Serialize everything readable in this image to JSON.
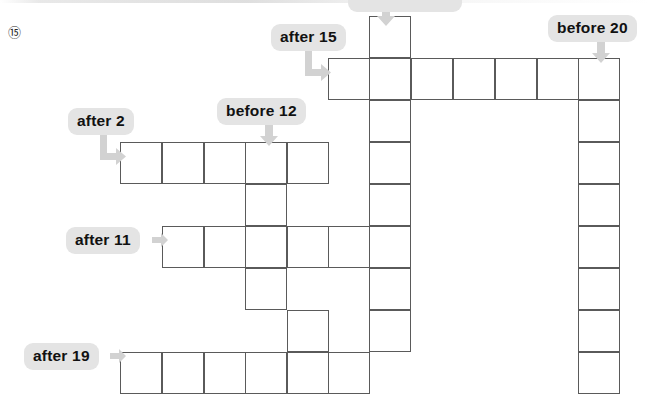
{
  "page": {
    "question_number": "⑮",
    "background": "#ffffff",
    "grid_line_color": "#5a5a5a",
    "tag_background": "#e4e4e4",
    "tag_text_color": "#111111",
    "arrow_color": "#d2d2d2"
  },
  "clues": [
    {
      "id": "clue-top-clipped",
      "label": "",
      "x": 348,
      "y": -8,
      "width": 96,
      "clipped": true,
      "arrow": "down",
      "arrow_x": 376,
      "arrow_y": 4
    },
    {
      "id": "clue-after-15",
      "label": "after 15",
      "x": 271,
      "y": 24,
      "arrow": "down-right",
      "arrow_x": 305,
      "arrow_y": 49
    },
    {
      "id": "clue-before-20",
      "label": "before 20",
      "x": 548,
      "y": 15,
      "arrow": "down",
      "arrow_x": 591,
      "arrow_y": 41
    },
    {
      "id": "clue-before-12",
      "label": "before 12",
      "x": 217,
      "y": 98,
      "arrow": "down",
      "arrow_x": 259,
      "arrow_y": 124
    },
    {
      "id": "clue-after-2",
      "label": "after 2",
      "x": 68,
      "y": 108,
      "arrow": "down-right",
      "arrow_x": 100,
      "arrow_y": 133
    },
    {
      "id": "clue-after-11",
      "label": "after 11",
      "x": 66,
      "y": 227,
      "arrow": "right",
      "arrow_x": 152,
      "arrow_y": 233
    },
    {
      "id": "clue-after-19",
      "label": "after 19",
      "x": 24,
      "y": 343,
      "arrow": "right",
      "arrow_x": 110,
      "arrow_y": 349
    }
  ],
  "grid": {
    "cell_size": 42,
    "columns_x": [
      120,
      162,
      204,
      245,
      287,
      328,
      369,
      411,
      453,
      495,
      537,
      578
    ],
    "rows_y": [
      16,
      58,
      100,
      142,
      184,
      226,
      268,
      310,
      352
    ],
    "cells": [
      {
        "name": "cell-r0-c6",
        "x": 369,
        "y": 16
      },
      {
        "name": "cell-r1-c5",
        "x": 328,
        "y": 58
      },
      {
        "name": "cell-r1-c6",
        "x": 369,
        "y": 58
      },
      {
        "name": "cell-r1-c7",
        "x": 411,
        "y": 58
      },
      {
        "name": "cell-r1-c8",
        "x": 453,
        "y": 58
      },
      {
        "name": "cell-r1-c9",
        "x": 495,
        "y": 58
      },
      {
        "name": "cell-r1-c10",
        "x": 537,
        "y": 58
      },
      {
        "name": "cell-r1-c11",
        "x": 578,
        "y": 58
      },
      {
        "name": "cell-r2-c11",
        "x": 578,
        "y": 100
      },
      {
        "name": "cell-r2-c6",
        "x": 369,
        "y": 100
      },
      {
        "name": "cell-r3-c0",
        "x": 120,
        "y": 142
      },
      {
        "name": "cell-r3-c1",
        "x": 162,
        "y": 142
      },
      {
        "name": "cell-r3-c2",
        "x": 204,
        "y": 142
      },
      {
        "name": "cell-r3-c3",
        "x": 245,
        "y": 142
      },
      {
        "name": "cell-r3-c4",
        "x": 287,
        "y": 142
      },
      {
        "name": "cell-r3-c6",
        "x": 369,
        "y": 142
      },
      {
        "name": "cell-r3-c11",
        "x": 578,
        "y": 142
      },
      {
        "name": "cell-r4-c3",
        "x": 245,
        "y": 184
      },
      {
        "name": "cell-r4-c6",
        "x": 369,
        "y": 184
      },
      {
        "name": "cell-r4-c11",
        "x": 578,
        "y": 184
      },
      {
        "name": "cell-r5-c1",
        "x": 162,
        "y": 226
      },
      {
        "name": "cell-r5-c2",
        "x": 204,
        "y": 226
      },
      {
        "name": "cell-r5-c3",
        "x": 245,
        "y": 226
      },
      {
        "name": "cell-r5-c4",
        "x": 287,
        "y": 226
      },
      {
        "name": "cell-r5-c5",
        "x": 328,
        "y": 226
      },
      {
        "name": "cell-r5-c6",
        "x": 369,
        "y": 226
      },
      {
        "name": "cell-r5-c11",
        "x": 578,
        "y": 226
      },
      {
        "name": "cell-r6-c3",
        "x": 245,
        "y": 268
      },
      {
        "name": "cell-r6-c6",
        "x": 369,
        "y": 268
      },
      {
        "name": "cell-r6-c11",
        "x": 578,
        "y": 268
      },
      {
        "name": "cell-r7-c4",
        "x": 287,
        "y": 310
      },
      {
        "name": "cell-r7-c6",
        "x": 369,
        "y": 310
      },
      {
        "name": "cell-r7-c11",
        "x": 578,
        "y": 310
      },
      {
        "name": "cell-r8-c0",
        "x": 120,
        "y": 352
      },
      {
        "name": "cell-r8-c1",
        "x": 162,
        "y": 352
      },
      {
        "name": "cell-r8-c2",
        "x": 204,
        "y": 352
      },
      {
        "name": "cell-r8-c3",
        "x": 245,
        "y": 352
      },
      {
        "name": "cell-r8-c4",
        "x": 287,
        "y": 352
      },
      {
        "name": "cell-r8-c5",
        "x": 328,
        "y": 352
      },
      {
        "name": "cell-r8-c11",
        "x": 578,
        "y": 352
      }
    ]
  }
}
